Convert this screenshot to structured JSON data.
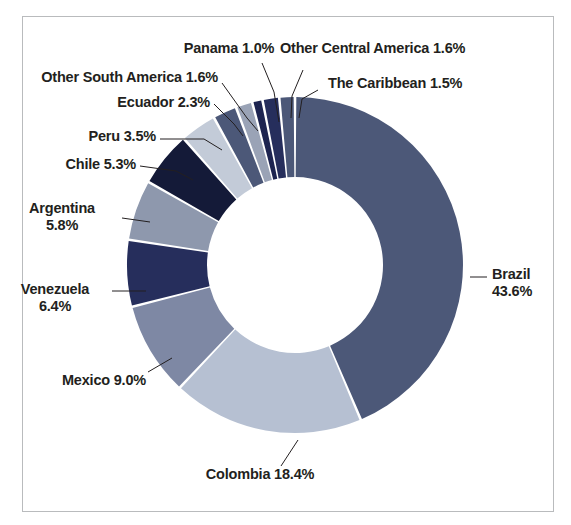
{
  "figure": {
    "background": "#ffffff",
    "frame_color": "#b9bbbd"
  },
  "chart_data": {
    "type": "pie",
    "variant": "donut",
    "title": "",
    "xlabel": "",
    "ylabel": "",
    "legend_position": "none",
    "grid": false,
    "units": "percent",
    "start_angle_deg": 0,
    "direction": "clockwise",
    "inner_radius_ratio": 0.524,
    "center": {
      "x": 295,
      "y": 265
    },
    "outer_radius": 168,
    "inner_radius": 88,
    "categories": [
      "Brazil",
      "Colombia",
      "Mexico",
      "Venezuela",
      "Argentina",
      "Chile",
      "Peru",
      "Ecuador",
      "Other South America",
      "Panama",
      "Other Central America",
      "The Caribbean"
    ],
    "values": [
      43.6,
      18.4,
      9.0,
      6.4,
      5.8,
      5.3,
      3.5,
      2.3,
      1.6,
      1.0,
      1.6,
      1.5
    ],
    "colors": [
      "#4c5878",
      "#b6c0d2",
      "#7e88a4",
      "#262e5c",
      "#8e98ad",
      "#141a38",
      "#c3cbd8",
      "#4c5878",
      "#9aa3b6",
      "#1d2450",
      "#262e5c",
      "#4c5878"
    ],
    "slices": [
      {
        "label": "Brazil",
        "value": 43.6,
        "text": "Brazil",
        "percent_text": "43.6%",
        "color": "#4c5878"
      },
      {
        "label": "Colombia",
        "value": 18.4,
        "text": "Colombia",
        "percent_text": "18.4%",
        "color": "#b6c0d2"
      },
      {
        "label": "Mexico",
        "value": 9.0,
        "text": "Mexico",
        "percent_text": "9.0%",
        "color": "#7e88a4"
      },
      {
        "label": "Venezuela",
        "value": 6.4,
        "text": "Venezuela",
        "percent_text": "6.4%",
        "color": "#262e5c"
      },
      {
        "label": "Argentina",
        "value": 5.8,
        "text": "Argentina",
        "percent_text": "5.8%",
        "color": "#8e98ad"
      },
      {
        "label": "Chile",
        "value": 5.3,
        "text": "Chile",
        "percent_text": "5.3%",
        "color": "#141a38"
      },
      {
        "label": "Peru",
        "value": 3.5,
        "text": "Peru",
        "percent_text": "3.5%",
        "color": "#c3cbd8"
      },
      {
        "label": "Ecuador",
        "value": 2.3,
        "text": "Ecuador",
        "percent_text": "2.3%",
        "color": "#4c5878"
      },
      {
        "label": "Other South America",
        "value": 1.6,
        "text": "Other South America",
        "percent_text": "1.6%",
        "color": "#9aa3b6"
      },
      {
        "label": "Panama",
        "value": 1.0,
        "text": "Panama",
        "percent_text": "1.0%",
        "color": "#1d2450"
      },
      {
        "label": "Other Central America",
        "value": 1.6,
        "text": "Other Central America",
        "percent_text": "1.6%",
        "color": "#262e5c"
      },
      {
        "label": "The Caribbean",
        "value": 1.5,
        "text": "The Caribbean",
        "percent_text": "1.5%",
        "color": "#4c5878"
      }
    ]
  },
  "labels": {
    "panama": "Panama 1.0%",
    "other_central_america": "Other Central America 1.6%",
    "the_caribbean": "The Caribbean 1.5%",
    "other_south_america": "Other South America 1.6%",
    "ecuador": "Ecuador 2.3%",
    "peru": "Peru 3.5%",
    "chile": "Chile 5.3%",
    "argentina_name": "Argentina",
    "argentina_pct": "5.8%",
    "venezuela_name": "Venezuela",
    "venezuela_pct": "6.4%",
    "mexico": "Mexico 9.0%",
    "colombia": "Colombia 18.4%",
    "brazil_name": "Brazil",
    "brazil_pct": "43.6%"
  }
}
